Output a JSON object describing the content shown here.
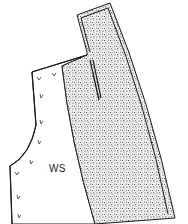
{
  "diagram": {
    "type": "sewing-pattern-piece",
    "labels": {
      "wrong_side": "WS"
    },
    "regions": [
      {
        "name": "facing-interfaced",
        "fill": "stippled"
      },
      {
        "name": "garment-wrong-side",
        "fill": "white"
      }
    ],
    "colors": {
      "line": "#1a1a1a",
      "stipple": "#2a2a2a",
      "background": "#ffffff"
    },
    "annotations": {
      "tick_marks": "v-shaped hand-stitch marks along left edge"
    }
  }
}
